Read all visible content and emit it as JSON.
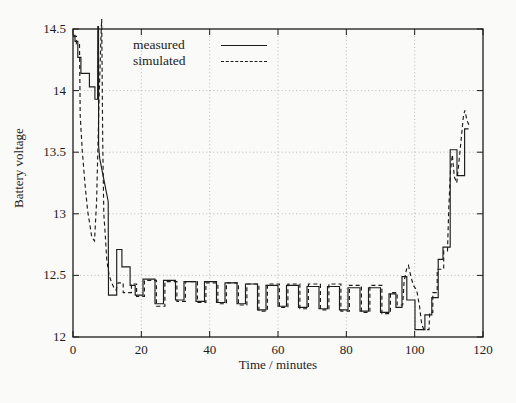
{
  "figure": {
    "x_axis_label": "Time / minutes",
    "y_axis_label": "Battery voltage"
  },
  "chart_data": {
    "type": "line",
    "title": "",
    "xlabel": "Time / minutes",
    "ylabel": "Battery voltage",
    "xlim": [
      0,
      120
    ],
    "ylim": [
      12,
      14.5
    ],
    "x_ticks": [
      0,
      20,
      40,
      60,
      80,
      100,
      120
    ],
    "y_ticks": [
      12,
      12.5,
      13,
      13.5,
      14,
      14.5
    ],
    "grid": true,
    "legend_position": "top-left-inside",
    "colors": {
      "line": "#1c1c1c",
      "grid": "#b2b2ab",
      "background": "#fafaf9"
    },
    "series": [
      {
        "name": "measured",
        "line_style": "solid",
        "points": [
          [
            0,
            14.45
          ],
          [
            0.6,
            14.45
          ],
          [
            0.6,
            14.4
          ],
          [
            1.4,
            14.4
          ],
          [
            1.4,
            14.27
          ],
          [
            2.3,
            14.27
          ],
          [
            2.3,
            14.14
          ],
          [
            4.8,
            14.14
          ],
          [
            4.8,
            14.03
          ],
          [
            6.4,
            14.03
          ],
          [
            6.4,
            13.93
          ],
          [
            7.2,
            13.93
          ],
          [
            7.25,
            14.52
          ],
          [
            7.45,
            14.52
          ],
          [
            7.5,
            13.55
          ],
          [
            7.8,
            13.45
          ],
          [
            10.3,
            13.1
          ],
          [
            10.4,
            12.34
          ],
          [
            12.8,
            12.34
          ],
          [
            12.8,
            12.71
          ],
          [
            14.3,
            12.71
          ],
          [
            14.3,
            12.57
          ],
          [
            16.7,
            12.57
          ],
          [
            16.7,
            12.42
          ],
          [
            18.2,
            12.42
          ],
          [
            18.2,
            12.34
          ],
          [
            20.5,
            12.34
          ],
          [
            20.5,
            12.47
          ],
          [
            24,
            12.47
          ],
          [
            24,
            12.27
          ],
          [
            26.5,
            12.27
          ],
          [
            26.5,
            12.46
          ],
          [
            30,
            12.46
          ],
          [
            30,
            12.3
          ],
          [
            32.5,
            12.3
          ],
          [
            32.5,
            12.45
          ],
          [
            36,
            12.45
          ],
          [
            36,
            12.29
          ],
          [
            38.5,
            12.29
          ],
          [
            38.5,
            12.45
          ],
          [
            42,
            12.45
          ],
          [
            42,
            12.28
          ],
          [
            44.5,
            12.28
          ],
          [
            44.5,
            12.44
          ],
          [
            48,
            12.44
          ],
          [
            48,
            12.27
          ],
          [
            50.5,
            12.27
          ],
          [
            50.5,
            12.43
          ],
          [
            54,
            12.43
          ],
          [
            54,
            12.22
          ],
          [
            56.5,
            12.22
          ],
          [
            56.5,
            12.42
          ],
          [
            60,
            12.42
          ],
          [
            60,
            12.25
          ],
          [
            62.5,
            12.25
          ],
          [
            62.5,
            12.42
          ],
          [
            66,
            12.42
          ],
          [
            66,
            12.24
          ],
          [
            68.5,
            12.24
          ],
          [
            68.5,
            12.41
          ],
          [
            72,
            12.41
          ],
          [
            72,
            12.23
          ],
          [
            74.5,
            12.23
          ],
          [
            74.5,
            12.41
          ],
          [
            78,
            12.41
          ],
          [
            78,
            12.22
          ],
          [
            80.5,
            12.22
          ],
          [
            80.5,
            12.4
          ],
          [
            84,
            12.4
          ],
          [
            84,
            12.21
          ],
          [
            86.5,
            12.21
          ],
          [
            86.5,
            12.4
          ],
          [
            90,
            12.4
          ],
          [
            90,
            12.2
          ],
          [
            92.5,
            12.2
          ],
          [
            92.5,
            12.35
          ],
          [
            94.5,
            12.35
          ],
          [
            94.5,
            12.24
          ],
          [
            96.3,
            12.24
          ],
          [
            96.3,
            12.49
          ],
          [
            97.7,
            12.49
          ],
          [
            97.7,
            12.3
          ],
          [
            100.1,
            12.3
          ],
          [
            100.1,
            12.06
          ],
          [
            103,
            12.06
          ],
          [
            103,
            12.18
          ],
          [
            105,
            12.18
          ],
          [
            105,
            12.32
          ],
          [
            106.9,
            12.32
          ],
          [
            106.9,
            12.63
          ],
          [
            108.3,
            12.63
          ],
          [
            108.3,
            12.73
          ],
          [
            110.4,
            12.73
          ],
          [
            110.4,
            13.52
          ],
          [
            112.4,
            13.52
          ],
          [
            112.4,
            13.31
          ],
          [
            114.6,
            13.31
          ],
          [
            114.6,
            13.69
          ],
          [
            115.8,
            13.69
          ]
        ]
      },
      {
        "name": "simulated",
        "line_style": "dashed",
        "points": [
          [
            0,
            14.44
          ],
          [
            1.0,
            14.44
          ],
          [
            1.0,
            14.38
          ],
          [
            1.9,
            14.38
          ],
          [
            2.1,
            13.8
          ],
          [
            2.7,
            13.52
          ],
          [
            3.5,
            13.24
          ],
          [
            4.3,
            13.02
          ],
          [
            5.0,
            12.9
          ],
          [
            5.5,
            12.81
          ],
          [
            6.3,
            12.78
          ],
          [
            6.9,
            13.1
          ],
          [
            7.6,
            13.9
          ],
          [
            8.2,
            14.45
          ],
          [
            8.4,
            14.58
          ],
          [
            8.7,
            13.6
          ],
          [
            9.0,
            13.0
          ],
          [
            9.4,
            12.85
          ],
          [
            9.9,
            12.62
          ],
          [
            10.6,
            12.5
          ],
          [
            11.3,
            12.44
          ],
          [
            12.0,
            12.4
          ],
          [
            12.6,
            12.38
          ],
          [
            13.2,
            12.44
          ],
          [
            14.7,
            12.44
          ],
          [
            14.7,
            12.36
          ],
          [
            17.1,
            12.36
          ],
          [
            17.1,
            12.43
          ],
          [
            18.6,
            12.43
          ],
          [
            18.6,
            12.33
          ],
          [
            20.9,
            12.33
          ],
          [
            20.9,
            12.46
          ],
          [
            24.4,
            12.46
          ],
          [
            24.4,
            12.25
          ],
          [
            26.9,
            12.25
          ],
          [
            26.9,
            12.45
          ],
          [
            30.4,
            12.45
          ],
          [
            30.4,
            12.29
          ],
          [
            32.9,
            12.29
          ],
          [
            32.9,
            12.45
          ],
          [
            36.4,
            12.45
          ],
          [
            36.4,
            12.28
          ],
          [
            38.9,
            12.28
          ],
          [
            38.9,
            12.44
          ],
          [
            42.4,
            12.44
          ],
          [
            42.4,
            12.27
          ],
          [
            44.9,
            12.27
          ],
          [
            44.9,
            12.44
          ],
          [
            48.4,
            12.44
          ],
          [
            48.4,
            12.26
          ],
          [
            50.9,
            12.26
          ],
          [
            50.9,
            12.43
          ],
          [
            54.4,
            12.43
          ],
          [
            54.4,
            12.21
          ],
          [
            56.9,
            12.21
          ],
          [
            56.9,
            12.43
          ],
          [
            60.4,
            12.43
          ],
          [
            60.4,
            12.24
          ],
          [
            62.9,
            12.24
          ],
          [
            62.9,
            12.43
          ],
          [
            66.4,
            12.43
          ],
          [
            66.4,
            12.23
          ],
          [
            68.9,
            12.23
          ],
          [
            68.9,
            12.43
          ],
          [
            72.4,
            12.43
          ],
          [
            72.4,
            12.22
          ],
          [
            74.9,
            12.22
          ],
          [
            74.9,
            12.43
          ],
          [
            78.4,
            12.43
          ],
          [
            78.4,
            12.21
          ],
          [
            80.9,
            12.21
          ],
          [
            80.9,
            12.42
          ],
          [
            84.4,
            12.42
          ],
          [
            84.4,
            12.2
          ],
          [
            86.9,
            12.2
          ],
          [
            86.9,
            12.42
          ],
          [
            90.4,
            12.42
          ],
          [
            90.4,
            12.19
          ],
          [
            92.9,
            12.19
          ],
          [
            92.9,
            12.36
          ],
          [
            94.9,
            12.36
          ],
          [
            94.9,
            12.26
          ],
          [
            96.5,
            12.26
          ],
          [
            96.9,
            12.45
          ],
          [
            97.6,
            12.55
          ],
          [
            98.2,
            12.58
          ],
          [
            98.8,
            12.5
          ],
          [
            99.6,
            12.42
          ],
          [
            100.6,
            12.38
          ],
          [
            101.4,
            12.25
          ],
          [
            102.1,
            12.1
          ],
          [
            102.7,
            12.06
          ],
          [
            104.2,
            12.06
          ],
          [
            104.4,
            12.2
          ],
          [
            105.3,
            12.2
          ],
          [
            105.3,
            12.36
          ],
          [
            106.6,
            12.36
          ],
          [
            106.6,
            12.55
          ],
          [
            108.5,
            12.55
          ],
          [
            108.5,
            12.7
          ],
          [
            109.6,
            12.7
          ],
          [
            110.0,
            13.05
          ],
          [
            110.5,
            13.35
          ],
          [
            111.0,
            13.48
          ],
          [
            111.6,
            13.3
          ],
          [
            112.3,
            13.25
          ],
          [
            112.9,
            13.4
          ],
          [
            113.6,
            13.6
          ],
          [
            114.3,
            13.8
          ],
          [
            114.7,
            13.84
          ],
          [
            115.3,
            13.76
          ],
          [
            115.9,
            13.72
          ]
        ]
      }
    ]
  }
}
